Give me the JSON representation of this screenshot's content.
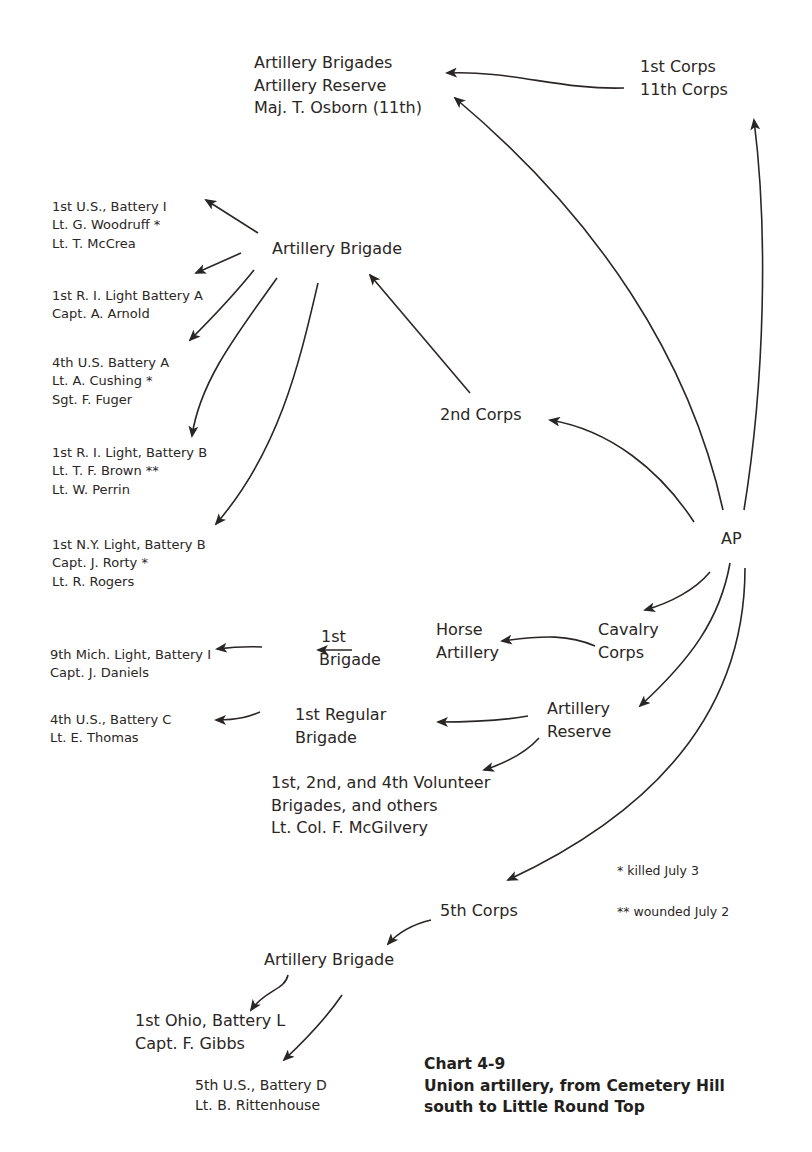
{
  "caption": {
    "number": "Chart 4-9",
    "title_line1": "Union artillery, from Cemetery Hill",
    "title_line2": "south to Little Round Top"
  },
  "legend": {
    "killed": "* killed July 3",
    "wounded": "** wounded July 2"
  },
  "nodes": {
    "ap": "AP",
    "corps_1_11": [
      "1st Corps",
      "11th Corps"
    ],
    "osborn": [
      "Artillery Brigades",
      "Artillery Reserve",
      "Maj. T. Osborn (11th)"
    ],
    "corps_2": "2nd Corps",
    "brigade_2": "Artillery Brigade",
    "batteries_2": [
      [
        "1st U.S., Battery I",
        "Lt. G. Woodruff *",
        "Lt. T. McCrea"
      ],
      [
        "1st R. I. Light Battery A",
        "Capt. A. Arnold"
      ],
      [
        "4th U.S. Battery A",
        "Lt. A. Cushing *",
        "Sgt. F. Fuger"
      ],
      [
        "1st R. I. Light, Battery B",
        "Lt. T. F. Brown **",
        "Lt. W. Perrin"
      ],
      [
        "1st N.Y. Light, Battery B",
        "Capt. J. Rorty *",
        "Lt. R. Rogers"
      ]
    ],
    "cavalry": [
      "Cavalry",
      "Corps"
    ],
    "horse_artillery": [
      "Horse",
      "Artillery"
    ],
    "first_brigade": [
      "1st",
      "Brigade"
    ],
    "mich": [
      "9th Mich. Light, Battery I",
      "Capt. J. Daniels"
    ],
    "reserve": [
      "Artillery",
      "Reserve"
    ],
    "regular": [
      "1st Regular",
      "Brigade"
    ],
    "us4c": [
      "4th U.S., Battery C",
      "Lt. E. Thomas"
    ],
    "volunteer": [
      "1st, 2nd, and 4th Volunteer",
      "Brigades, and others",
      "Lt. Col. F. McGilvery"
    ],
    "corps_5": "5th Corps",
    "brigade_5": "Artillery Brigade",
    "ohio": [
      "1st Ohio, Battery L",
      "Capt. F. Gibbs"
    ],
    "us5d": [
      "5th U.S., Battery D",
      "Lt. B. Rittenhouse"
    ]
  },
  "colors": {
    "ink": "#2a2624",
    "background": "#ffffff"
  }
}
